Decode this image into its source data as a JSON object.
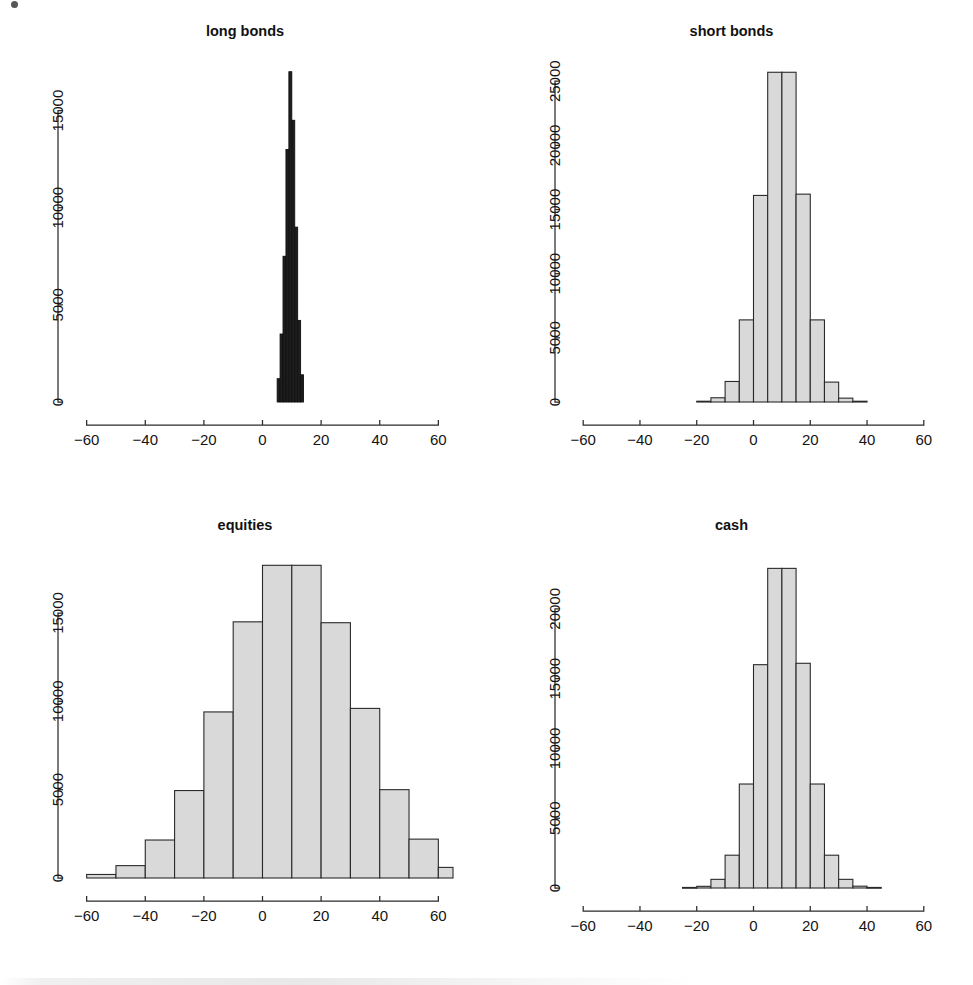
{
  "figure": {
    "background_color": "#ffffff",
    "bar_fill_color": "#d9d9d9",
    "bar_stroke_color": "#2a2a2a",
    "dense_bar_color": "#1d1d1d",
    "axis_color": "#2b2b2b",
    "layout": "2x2 grid of histogram panels"
  },
  "chart_data": [
    {
      "type": "bar",
      "panel": "top-left",
      "title": "long bonds",
      "xlabel": "",
      "ylabel": "",
      "xlim": [
        -65,
        65
      ],
      "ylim": [
        0,
        17500
      ],
      "xticks": [
        -60,
        -40,
        -20,
        0,
        20,
        40,
        60
      ],
      "yticks": [
        0,
        5000,
        10000,
        15000
      ],
      "grid": false,
      "legend": "none",
      "bin_width": 1,
      "bin_edges": [
        5,
        6,
        7,
        8,
        9,
        10,
        11,
        12,
        13,
        14
      ],
      "categories": [
        "5-6",
        "6-7",
        "7-8",
        "8-9",
        "9-10",
        "10-11",
        "11-12",
        "12-13",
        "13-14"
      ],
      "values": [
        1200,
        3500,
        7500,
        13000,
        17000,
        14500,
        9000,
        4200,
        1400
      ]
    },
    {
      "type": "bar",
      "panel": "top-right",
      "title": "short bonds",
      "xlabel": "",
      "ylabel": "",
      "xlim": [
        -65,
        65
      ],
      "ylim": [
        0,
        26500
      ],
      "xticks": [
        -60,
        -40,
        -20,
        0,
        20,
        40,
        60
      ],
      "yticks": [
        0,
        5000,
        10000,
        15000,
        20000,
        25000
      ],
      "grid": false,
      "legend": "none",
      "bin_width": 5,
      "bin_edges": [
        -20,
        -15,
        -10,
        -5,
        0,
        5,
        10,
        15,
        20,
        25,
        30,
        35,
        40
      ],
      "categories": [
        "-20--15",
        "-15--10",
        "-10--5",
        "-5-0",
        "0-5",
        "5-10",
        "10-15",
        "15-20",
        "20-25",
        "25-30",
        "30-35",
        "35-40"
      ],
      "values": [
        60,
        330,
        1600,
        6400,
        16100,
        25700,
        25700,
        16200,
        6400,
        1550,
        300,
        60
      ]
    },
    {
      "type": "bar",
      "panel": "bottom-left",
      "title": "equities",
      "xlabel": "",
      "ylabel": "",
      "xlim": [
        -65,
        65
      ],
      "ylim": [
        0,
        18000
      ],
      "xticks": [
        -60,
        -40,
        -20,
        0,
        20,
        40,
        60
      ],
      "yticks": [
        0,
        5000,
        10000,
        15000
      ],
      "grid": false,
      "legend": "none",
      "bin_width": 10,
      "bin_edges": [
        -60,
        -50,
        -40,
        -30,
        -20,
        -10,
        0,
        10,
        20,
        30,
        40,
        50,
        60,
        65
      ],
      "categories": [
        "-60--50",
        "-50--40",
        "-40--30",
        "-30--20",
        "-20--10",
        "-10-0",
        "0-10",
        "10-20",
        "20-30",
        "30-40",
        "40-50",
        "50-60",
        "60-65"
      ],
      "values": [
        200,
        700,
        2150,
        4950,
        9400,
        14500,
        17700,
        17700,
        14450,
        9600,
        5000,
        2200,
        600
      ]
    },
    {
      "type": "bar",
      "panel": "bottom-right",
      "title": "cash",
      "xlabel": "",
      "ylabel": "",
      "xlim": [
        -65,
        65
      ],
      "ylim": [
        0,
        23500
      ],
      "xticks": [
        -60,
        -40,
        -20,
        0,
        20,
        40,
        60
      ],
      "yticks": [
        0,
        5000,
        10000,
        15000,
        20000
      ],
      "grid": false,
      "legend": "none",
      "bin_width": 5,
      "bin_edges": [
        -25,
        -20,
        -15,
        -10,
        -5,
        0,
        5,
        10,
        15,
        20,
        25,
        30,
        35,
        40,
        45
      ],
      "categories": [
        "-25--20",
        "-20--15",
        "-15--10",
        "-10--5",
        "-5-0",
        "0-5",
        "5-10",
        "10-15",
        "15-20",
        "20-25",
        "25-30",
        "30-35",
        "35-40",
        "40-45"
      ],
      "values": [
        40,
        120,
        620,
        2350,
        7450,
        16000,
        22900,
        22900,
        16100,
        7450,
        2350,
        620,
        130,
        40
      ]
    }
  ]
}
